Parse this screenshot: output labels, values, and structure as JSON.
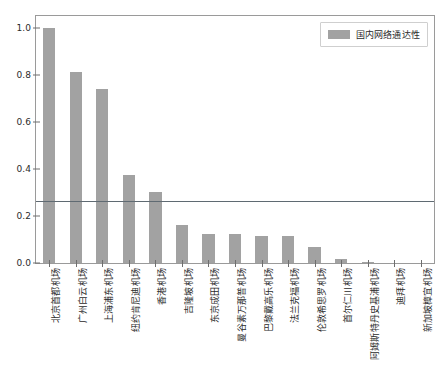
{
  "chart_data": {
    "type": "bar",
    "title": "",
    "xlabel": "",
    "ylabel": "",
    "ylim": [
      0.0,
      1.05
    ],
    "yticks": [
      "0.0",
      "0.2",
      "0.4",
      "0.6",
      "0.8",
      "1.0"
    ],
    "ytick_values": [
      0.0,
      0.2,
      0.4,
      0.6,
      0.8,
      1.0
    ],
    "grid": false,
    "legend_position": "upper right",
    "legend": [
      "国内网络通达性"
    ],
    "bar_color": "#a2a2a2",
    "reference_line": {
      "value": 0.265,
      "color": "#5f6a72",
      "orientation": "horizontal"
    },
    "categories": [
      "北京首都机场",
      "广州白云机场",
      "上海浦东机场",
      "纽约肯尼迪机场",
      "香港机场",
      "吉隆坡机场",
      "东京成田机场",
      "曼谷素万那普机场",
      "巴黎戴高乐机场",
      "法兰克福机场",
      "伦敦希思罗机场",
      "首尔仁川机场",
      "阿姆斯特丹史基浦机场",
      "迪拜机场",
      "新加坡樟宜机场"
    ],
    "series": [
      {
        "name": "国内网络通达性",
        "values": [
          1.0,
          0.813,
          0.738,
          0.376,
          0.303,
          0.162,
          0.123,
          0.123,
          0.114,
          0.113,
          0.068,
          0.018,
          0.004,
          0.001,
          0.0
        ]
      }
    ]
  },
  "legend": {
    "label": "国内网络通达性"
  }
}
